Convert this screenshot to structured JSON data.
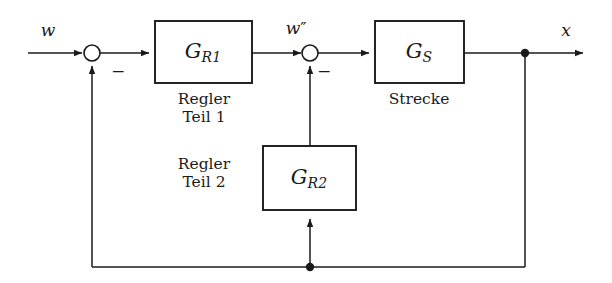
{
  "diagram": {
    "type": "control-block-diagram",
    "canvas": {
      "width": 612,
      "height": 283,
      "background": "#ffffff"
    },
    "line_color": "#1a1a1a",
    "text_color": "#1a1a1a",
    "signals": {
      "input": {
        "name": "w",
        "label": "w",
        "x": 48,
        "y": 32
      },
      "inner": {
        "name": "w-double-prime",
        "label": "w″",
        "base": "w",
        "primes": "″",
        "x": 295,
        "y": 30
      },
      "output": {
        "name": "x",
        "label": "x",
        "x": 566,
        "y": 32
      }
    },
    "blocks": [
      {
        "id": "gr1",
        "label": "G",
        "subscript": "R1",
        "caption_line1": "Regler",
        "caption_line2": "Teil 1",
        "x": 155,
        "y": 21,
        "width": 97,
        "height": 62
      },
      {
        "id": "gs",
        "label": "G",
        "subscript": "S",
        "caption_line1": "Strecke",
        "caption_line2": "",
        "x": 375,
        "y": 21,
        "width": 89,
        "height": 62
      },
      {
        "id": "gr2",
        "label": "G",
        "subscript": "R2",
        "caption_line1": "Regler",
        "caption_line2": "Teil 2",
        "x": 263,
        "y": 146,
        "width": 93,
        "height": 64
      }
    ],
    "summing_junctions": [
      {
        "id": "sum1",
        "cx": 92,
        "cy": 53,
        "r": 8,
        "sign": "−",
        "sign_x": 118,
        "sign_y": 71
      },
      {
        "id": "sum2",
        "cx": 310,
        "cy": 53,
        "r": 8,
        "sign": "−",
        "sign_x": 324,
        "sign_y": 71
      }
    ],
    "junction_dots": [
      {
        "id": "output-tap",
        "cx": 525,
        "cy": 53,
        "r": 4.2
      },
      {
        "id": "feedback-tap",
        "cx": 310,
        "cy": 267,
        "r": 4.2
      }
    ],
    "feedback_paths": {
      "outer_bottom_y": 267,
      "outer_left_x": 92,
      "outer_right_x": 525,
      "inner_tap_x": 310
    }
  }
}
